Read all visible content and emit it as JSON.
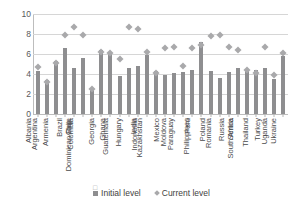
{
  "chart_data": {
    "type": "bar",
    "title": "",
    "subtitle": "",
    "xlabel": "",
    "ylabel": "",
    "ylim": [
      0,
      10
    ],
    "ytick_values": [
      0,
      2,
      4,
      6,
      8,
      10
    ],
    "ytick_labels": [
      "0",
      "2",
      "4",
      "6",
      "8",
      "10"
    ],
    "grid": true,
    "legend_position": "bottom",
    "categories": [
      "Albania",
      "Argentina",
      "Armenia",
      "Brazil",
      "Chile",
      "Colombia",
      "Dominican Rep.",
      "Georgia",
      "Ghana",
      "Guatemala",
      "Hungary",
      "India",
      "Indonesia",
      "Kazakhstan",
      "Mexico",
      "Moldova",
      "Paraguay",
      "Peru",
      "Philippines",
      "Poland",
      "Romania",
      "Russia",
      "Serbia",
      "South Africa",
      "Thailand",
      "Turkey",
      "Uganda",
      "Ukraine"
    ],
    "series": [
      {
        "name": "Initial level",
        "render": "bar",
        "color": "#8e8e90",
        "values": [
          4.3,
          3.4,
          5.3,
          6.6,
          4.6,
          5.6,
          2.6,
          6.4,
          6.2,
          3.8,
          4.6,
          4.8,
          5.9,
          4.3,
          3.9,
          4.1,
          4.2,
          4.4,
          7.2,
          4.3,
          3.6,
          4.2,
          4.6,
          4.3,
          4.4,
          4.6,
          3.5,
          5.8
        ]
      },
      {
        "name": "Current level",
        "render": "diamond",
        "color": "#a9a9ab",
        "values": [
          5.0,
          3.5,
          5.4,
          8.2,
          9.0,
          8.2,
          2.8,
          6.5,
          6.4,
          5.8,
          9.0,
          8.8,
          6.5,
          4.4,
          6.9,
          7.0,
          5.1,
          6.9,
          7.2,
          8.1,
          8.2,
          7.0,
          6.7,
          4.7,
          4.4,
          7.0,
          4.2,
          6.4
        ]
      }
    ]
  },
  "legend": {
    "items": [
      {
        "label": "Initial level",
        "marker": "square-swatch"
      },
      {
        "label": "Current level",
        "marker": "diamond-swatch"
      }
    ]
  },
  "artifacts": {
    "stray_glyph": "□"
  }
}
